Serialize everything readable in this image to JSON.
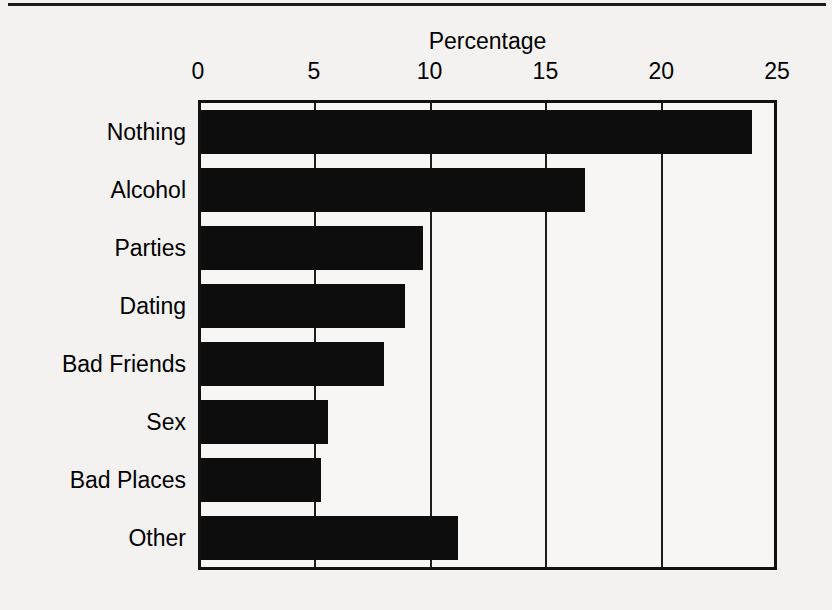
{
  "figure": {
    "has_top_rule": true,
    "background_color": "#f3f2f0",
    "bar_color": "#0d0d0d",
    "axis_color": "#111111"
  },
  "chart_data": {
    "type": "bar",
    "orientation": "horizontal",
    "title": "Percentage",
    "xlabel": "",
    "ylabel": "",
    "categories": [
      "Nothing",
      "Alcohol",
      "Parties",
      "Dating",
      "Bad Friends",
      "Sex",
      "Bad Places",
      "Other"
    ],
    "values": [
      23.8,
      16.6,
      9.6,
      8.8,
      7.9,
      5.5,
      5.2,
      11.1
    ],
    "xlim": [
      0,
      25
    ],
    "xticks": [
      0,
      5,
      10,
      15,
      20,
      25
    ],
    "xtick_labels": [
      "0",
      "5",
      "10",
      "15",
      "20",
      "25"
    ],
    "gridlines": [
      5,
      10,
      15,
      20
    ],
    "grid": true,
    "legend": null
  }
}
